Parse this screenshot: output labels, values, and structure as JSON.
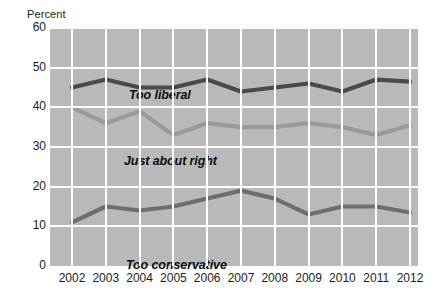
{
  "axis": {
    "y_title": "Percent",
    "y_ticks": [
      "60",
      "50",
      "40",
      "30",
      "20",
      "10",
      "0"
    ],
    "x_ticks": [
      "2002",
      "2003",
      "2004",
      "2005",
      "2006",
      "2007",
      "2008",
      "2009",
      "2010",
      "2011",
      "2012"
    ]
  },
  "series_labels": {
    "too_liberal": "Too liberal",
    "just_about_right": "Just about right",
    "too_conservative": "Too conservative"
  },
  "colors": {
    "plot_background": "#b9b9b9",
    "gridline": "#ffffff",
    "too_liberal": "#4a4a4a",
    "just_about_right": "#9a9a9a",
    "too_conservative": "#6e6e6e",
    "text": "#1b1b1b"
  },
  "chart_data": {
    "type": "line",
    "title": "",
    "xlabel": "",
    "ylabel": "Percent",
    "ylim": [
      0,
      60
    ],
    "ytick_step": 10,
    "grid": true,
    "legend": "inline-labels",
    "x": [
      "2002",
      "2003",
      "2004",
      "2005",
      "2006",
      "2007",
      "2008",
      "2009",
      "2010",
      "2011",
      "2012"
    ],
    "series": [
      {
        "name": "Too liberal",
        "color": "#4a4a4a",
        "values": [
          45,
          47,
          45,
          45,
          47,
          44,
          45,
          46,
          44,
          47,
          46.5
        ]
      },
      {
        "name": "Just about right",
        "color": "#9a9a9a",
        "values": [
          40,
          36,
          39,
          33,
          36,
          35,
          35,
          36,
          35,
          33,
          35.5
        ]
      },
      {
        "name": "Too conservative",
        "color": "#6e6e6e",
        "values": [
          11,
          15,
          14,
          15,
          17,
          19,
          17,
          13,
          15,
          15,
          13.5
        ]
      }
    ]
  }
}
